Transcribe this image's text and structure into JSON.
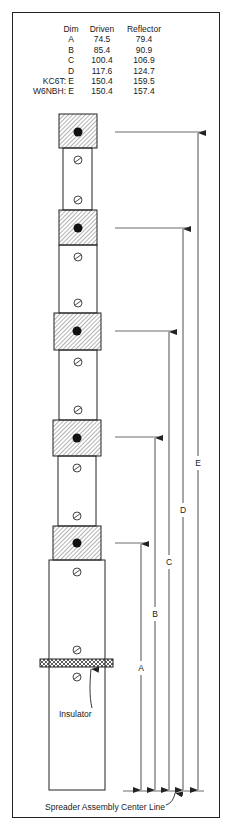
{
  "table": {
    "headers": {
      "dim": "Dim",
      "driven": "Driven",
      "reflector": "Reflector"
    },
    "rows": [
      {
        "call": "",
        "dim": "A",
        "driven": "74.5",
        "reflector": "79.4"
      },
      {
        "call": "",
        "dim": "B",
        "driven": "85.4",
        "reflector": "90.9"
      },
      {
        "call": "",
        "dim": "C",
        "driven": "100.4",
        "reflector": "106.9"
      },
      {
        "call": "",
        "dim": "D",
        "driven": "117.6",
        "reflector": "124.7"
      },
      {
        "call": "KC6T:",
        "dim": "E",
        "driven": "150.4",
        "reflector": "159.5"
      },
      {
        "call": "W6NBH:",
        "dim": "E",
        "driven": "150.4",
        "reflector": "157.4"
      }
    ]
  },
  "dimensions": {
    "a": "A",
    "b": "B",
    "c": "C",
    "d": "D",
    "e": "E"
  },
  "labels": {
    "insulator": "Insulator",
    "center_line": "Spreader Assembly Center Line"
  },
  "colors": {
    "line": "#222222",
    "hatch": "#555555",
    "background": "#ffffff"
  }
}
